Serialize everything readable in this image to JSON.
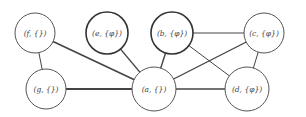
{
  "graph": {
    "width": 306,
    "height": 117,
    "colors": {
      "edge": "#444444",
      "node_border": "#555555",
      "node_border_bold": "#333333",
      "node_fill": "#ffffff",
      "label": "#444444"
    },
    "nodes": [
      {
        "id": "f",
        "label": "(f, {})",
        "x": 35,
        "y": 33,
        "r": 20,
        "bold": false
      },
      {
        "id": "e",
        "label": "(e, {φ})",
        "x": 107,
        "y": 33,
        "r": 21,
        "bold": true
      },
      {
        "id": "b",
        "label": "(b, {φ})",
        "x": 172,
        "y": 33,
        "r": 21,
        "bold": true
      },
      {
        "id": "c",
        "label": "(c, {φ})",
        "x": 264,
        "y": 33,
        "r": 20,
        "bold": false
      },
      {
        "id": "g",
        "label": "(g, {})",
        "x": 46,
        "y": 89,
        "r": 20,
        "bold": false
      },
      {
        "id": "a",
        "label": "(a, {})",
        "x": 154,
        "y": 89,
        "r": 22,
        "bold": false
      },
      {
        "id": "d",
        "label": "(d, {φ})",
        "x": 247,
        "y": 89,
        "r": 22,
        "bold": false
      }
    ],
    "edges": [
      {
        "from": "f",
        "to": "g",
        "width": 1
      },
      {
        "from": "f",
        "to": "a",
        "width": 1.6
      },
      {
        "from": "e",
        "to": "a",
        "width": 1.2
      },
      {
        "from": "g",
        "to": "a",
        "width": 2
      },
      {
        "from": "b",
        "to": "a",
        "width": 1.4
      },
      {
        "from": "b",
        "to": "c",
        "width": 1.2
      },
      {
        "from": "b",
        "to": "d",
        "width": 1
      },
      {
        "from": "c",
        "to": "a",
        "width": 1.4
      },
      {
        "from": "c",
        "to": "d",
        "width": 1
      },
      {
        "from": "a",
        "to": "d",
        "width": 1.4
      }
    ]
  }
}
